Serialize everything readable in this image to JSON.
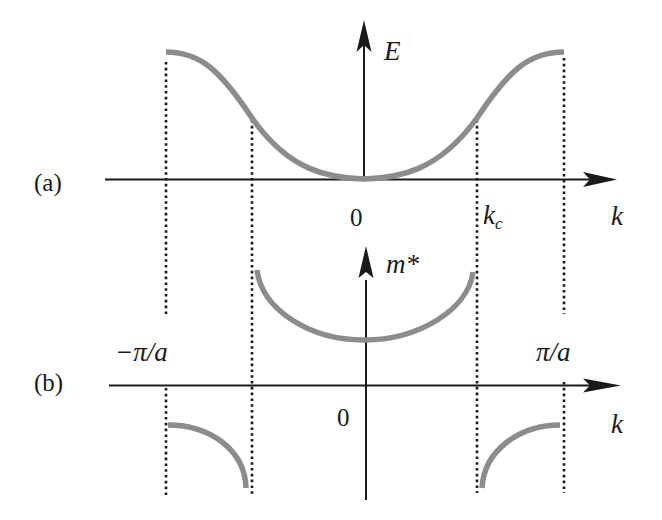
{
  "panels": {
    "a": {
      "label": "(a)",
      "y_axis_label": "E",
      "x_axis_label": "k",
      "origin_label": "0",
      "kc_label_main": "k",
      "kc_label_sub": "c",
      "curve": "E(k) = cosine-like band, minimum at k=0, maximum at ±π/a, inflection at ±k_c"
    },
    "b": {
      "label": "(b)",
      "y_axis_label": "m*",
      "x_axis_label": "k",
      "origin_label": "0",
      "left_boundary_label": "−π/a",
      "right_boundary_label": "π/a",
      "curve": "m*(k) positive for |k|<k_c, diverging at ±k_c, negative for k_c<|k|<π/a"
    }
  },
  "colors": {
    "curve": "#8c8c8c",
    "axis": "#1a1a1a",
    "guide": "#1a1a1a",
    "background": "#ffffff"
  },
  "guides": {
    "positions": [
      "−π/a",
      "−k_c",
      "k_c",
      "π/a"
    ],
    "style": "dotted"
  }
}
